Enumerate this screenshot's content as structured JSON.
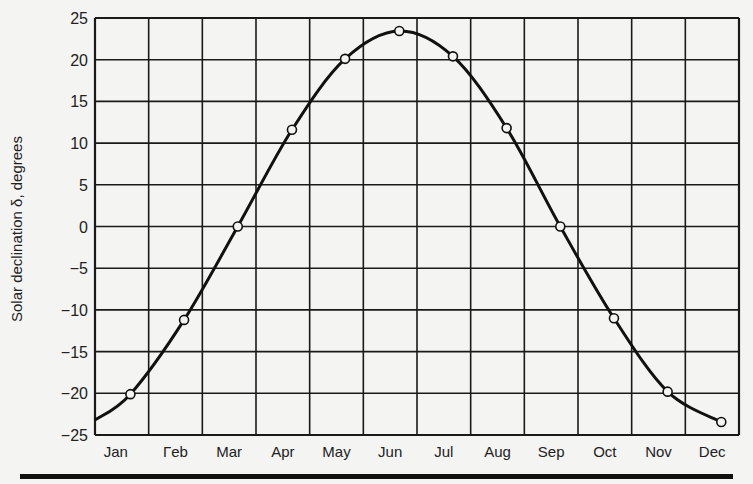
{
  "chart_data": {
    "type": "line",
    "title": "",
    "xlabel": "",
    "ylabel": "Solar declination δ, degrees",
    "categories": [
      "Jan",
      "Feb",
      "Mar",
      "Apr",
      "May",
      "Jun",
      "Jul",
      "Aug",
      "Sep",
      "Oct",
      "Nov",
      "Dec"
    ],
    "category_display": [
      "Jan",
      "Гeb",
      "Mar",
      "Apr",
      "May",
      "Jun",
      "Jul",
      "Aug",
      "Sep",
      "Oct",
      "Nov",
      "Dec"
    ],
    "series": [
      {
        "name": "Solar declination",
        "marker": "open-circle",
        "color": "#111111",
        "x_month_fraction": [
          0.66,
          1.66,
          2.66,
          3.67,
          4.66,
          5.67,
          6.67,
          7.67,
          8.67,
          9.67,
          10.67,
          11.67
        ],
        "values": [
          -20.1,
          -11.2,
          0.0,
          11.6,
          20.1,
          23.45,
          20.4,
          11.8,
          0.0,
          -11.0,
          -19.8,
          -23.45
        ]
      }
    ],
    "curve_start": {
      "x_month_fraction": 0.0,
      "value": -23.2
    },
    "yticks": [
      25,
      20,
      15,
      10,
      5,
      0,
      -5,
      -10,
      -15,
      -20,
      -25
    ],
    "ylim": [
      -25,
      25
    ],
    "xlim": [
      0,
      12
    ],
    "grid": true,
    "legend": null
  }
}
